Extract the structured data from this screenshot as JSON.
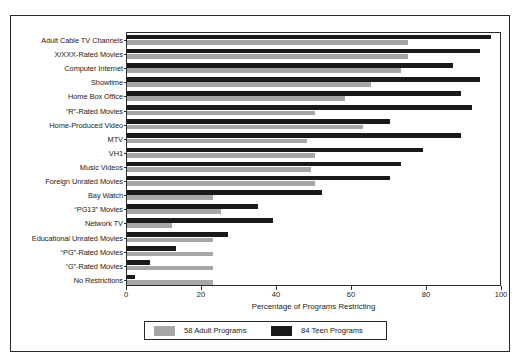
{
  "chart_data": {
    "type": "bar",
    "orientation": "horizontal",
    "title": "",
    "xlabel": "Percentage of Programs Restricting",
    "ylabel": "",
    "xlim": [
      0,
      100
    ],
    "xticks": [
      0,
      20,
      40,
      60,
      80,
      100
    ],
    "xtick_labels": [
      "0",
      "20",
      "40",
      "60",
      "80",
      "100"
    ],
    "grid": false,
    "legend_position": "bottom-center",
    "categories": [
      "Adult  Cable TV Channels",
      "X/XXX-Rated Movies",
      "Computer Internet",
      "Showtime",
      "Home Box Office",
      "“R”-Rated Movies",
      "Home-Produced Video",
      "MTV",
      "VH1",
      "Music Videos",
      "Foreign Unrated Movies",
      "Bay Watch",
      "“PG13” Movies",
      "Network TV",
      "Educational Unrated Movies",
      "“PG”-Rated Movies",
      "“G”-Rated Movies",
      "No Restrictions"
    ],
    "series": [
      {
        "name": "58 Adult Programs",
        "color": "#a6a6a6",
        "values": [
          75,
          75,
          73,
          65,
          58,
          50,
          63,
          48,
          50,
          49,
          50,
          23,
          25,
          12,
          23,
          23,
          23,
          23
        ]
      },
      {
        "name": "84 Teen Programs",
        "color": "#1a1a1a",
        "values": [
          97,
          94,
          87,
          94,
          89,
          92,
          70,
          89,
          79,
          73,
          70,
          52,
          35,
          39,
          27,
          13,
          6,
          2
        ]
      }
    ]
  },
  "legend": {
    "entries": [
      {
        "label": "58 Adult Programs",
        "color": "#a6a6a6"
      },
      {
        "label": "84 Teen Programs",
        "color": "#1a1a1a"
      }
    ]
  },
  "axis": {
    "x_title": "Percentage of Programs Restricting",
    "x_tick_labels": [
      "0",
      "20",
      "40",
      "60",
      "80",
      "100"
    ]
  }
}
